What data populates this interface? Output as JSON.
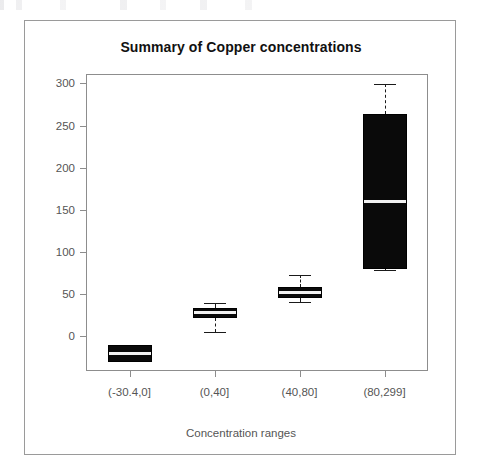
{
  "figure": {
    "title": "Summary of Copper concentrations",
    "x_axis_title": "Concentration ranges"
  },
  "chart_data": {
    "type": "boxplot",
    "title": "Summary of Copper concentrations",
    "xlabel": "Concentration ranges",
    "ylabel": "",
    "ylim": [
      -40,
      310
    ],
    "yticks": [
      0,
      50,
      100,
      150,
      200,
      250,
      300
    ],
    "ytick_labels": [
      "0",
      "50",
      "100",
      "150",
      "200",
      "250",
      "300"
    ],
    "grid": false,
    "legend": "none",
    "categories": [
      "(-30.4,0]",
      "(0,40]",
      "(40,80]",
      "(80,299]"
    ],
    "boxes": [
      {
        "category": "(-30.4,0]",
        "whisker_low": -30,
        "q1": -30,
        "median": -20,
        "q3": -10,
        "whisker_high": -10,
        "has_whiskers": false
      },
      {
        "category": "(0,40]",
        "whisker_low": 5,
        "q1": 22,
        "median": 28,
        "q3": 34,
        "whisker_high": 40,
        "has_whiskers": true
      },
      {
        "category": "(40,80]",
        "whisker_low": 41,
        "q1": 46,
        "median": 52,
        "q3": 58,
        "whisker_high": 73,
        "has_whiskers": true
      },
      {
        "category": "(80,299]",
        "whisker_low": 79,
        "q1": 80,
        "median": 160,
        "q3": 264,
        "whisker_high": 299,
        "has_whiskers": true
      }
    ],
    "colors": {
      "box_fill": "#0a0a0a",
      "box_edge": "#000000",
      "median": "#f2f2f2",
      "whisker": "#1a1a1a",
      "axis": "#8d8d8d",
      "tick_label": "#555555",
      "title": "#111111",
      "frame": "#9a9a9a",
      "background": "#ffffff"
    }
  }
}
